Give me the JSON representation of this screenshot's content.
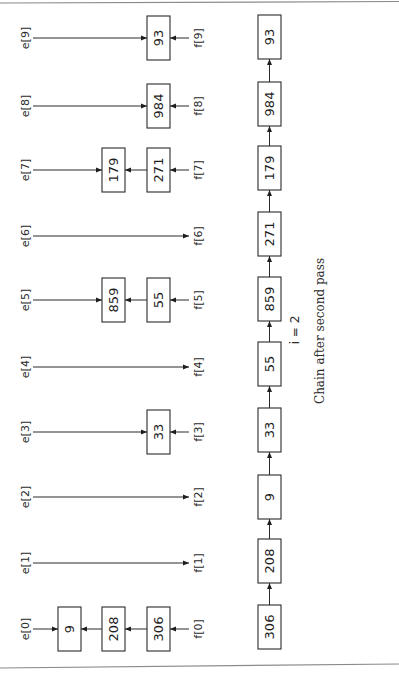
{
  "figure": {
    "orientation": "rotated-90-ccw",
    "caption": "Chain after second pass",
    "pass_label": "i = 2",
    "head_array_name": "e",
    "tail_array_name": "f",
    "buckets": [
      {
        "index": 0,
        "e_label": "e[0]",
        "f_label": "f[0]",
        "nodes": [
          "9",
          "208",
          "306"
        ]
      },
      {
        "index": 1,
        "e_label": "e[1]",
        "f_label": "f[1]",
        "nodes": []
      },
      {
        "index": 2,
        "e_label": "e[2]",
        "f_label": "f[2]",
        "nodes": []
      },
      {
        "index": 3,
        "e_label": "e[3]",
        "f_label": "f[3]",
        "nodes": [
          "33"
        ]
      },
      {
        "index": 4,
        "e_label": "e[4]",
        "f_label": "f[4]",
        "nodes": []
      },
      {
        "index": 5,
        "e_label": "e[5]",
        "f_label": "f[5]",
        "nodes": [
          "859",
          "55"
        ]
      },
      {
        "index": 6,
        "e_label": "e[6]",
        "f_label": "f[6]",
        "nodes": []
      },
      {
        "index": 7,
        "e_label": "e[7]",
        "f_label": "f[7]",
        "nodes": [
          "179",
          "271"
        ]
      },
      {
        "index": 8,
        "e_label": "e[8]",
        "f_label": "f[8]",
        "nodes": [
          "984"
        ]
      },
      {
        "index": 9,
        "e_label": "e[9]",
        "f_label": "f[9]",
        "nodes": [
          "93"
        ]
      }
    ],
    "chain": [
      "306",
      "208",
      "9",
      "33",
      "55",
      "859",
      "271",
      "179",
      "984",
      "93"
    ]
  }
}
